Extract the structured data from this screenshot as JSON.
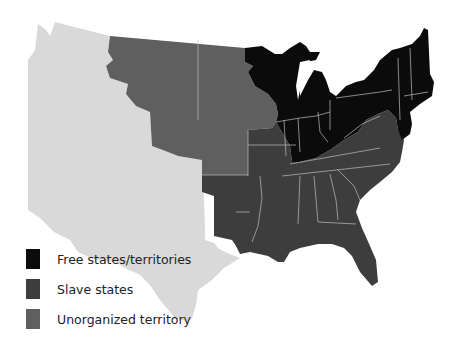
{
  "map": {
    "colors": {
      "free": "#0b0b0b",
      "slave": "#3d3d3d",
      "unorganized": "#5f5f5f",
      "other": "#d9d9d9",
      "border": "#bdbdbd"
    }
  },
  "legend": {
    "items": [
      {
        "label": "Free states/territories",
        "color": "#0b0b0b"
      },
      {
        "label": "Slave states",
        "color": "#3d3d3d"
      },
      {
        "label": "Unorganized territory",
        "color": "#5f5f5f"
      }
    ]
  }
}
